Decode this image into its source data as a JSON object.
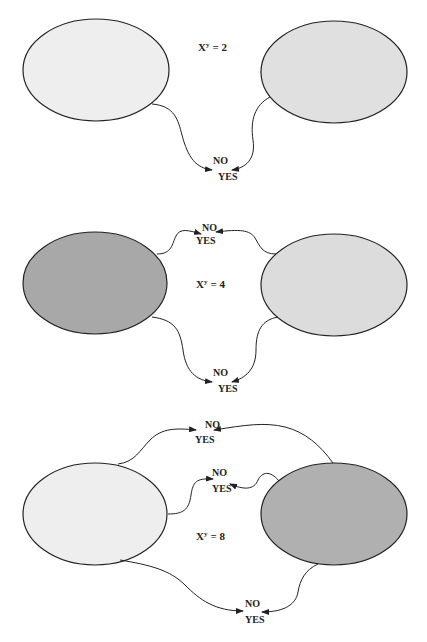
{
  "panels": [
    {
      "equation": {
        "base": "X",
        "exp": "y",
        "rhs": "= 2"
      },
      "left_fill": "#eeeeee",
      "right_fill": "#e0e0e0",
      "nodes": [
        {
          "no": "NO",
          "yes": "YES"
        }
      ]
    },
    {
      "equation": {
        "base": "X",
        "exp": "y",
        "rhs": "= 4"
      },
      "left_fill": "#a8a8a8",
      "right_fill": "#dcdcdc",
      "nodes": [
        {
          "no": "NO",
          "yes": "YES"
        },
        {
          "no": "NO",
          "yes": "YES"
        }
      ]
    },
    {
      "equation": {
        "base": "X",
        "exp": "y",
        "rhs": "= 8"
      },
      "left_fill": "#eeeeee",
      "right_fill": "#b0b0b0",
      "nodes": [
        {
          "no": "NO",
          "yes": "YES"
        },
        {
          "no": "NO",
          "yes": "YES"
        },
        {
          "no": "NO",
          "yes": "YES"
        }
      ]
    }
  ]
}
